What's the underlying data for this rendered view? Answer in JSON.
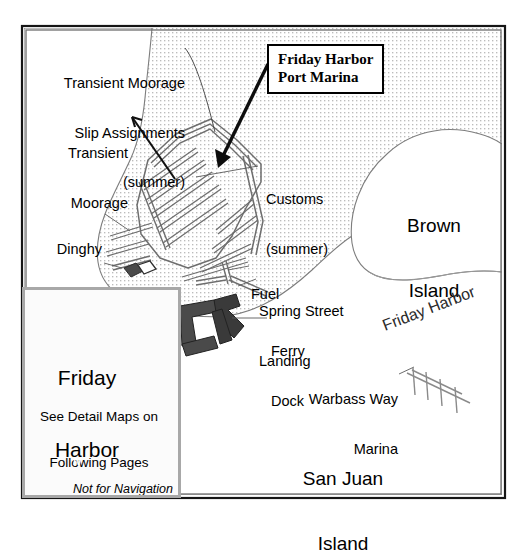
{
  "map": {
    "title_box": {
      "line1": "Friday Harbor",
      "line2": "Port Marina"
    },
    "water_body_label": "Friday Harbor",
    "land_labels": [
      {
        "name": "brown-island",
        "line1": "Brown",
        "line2": "Island"
      },
      {
        "name": "san-juan-island",
        "line1": "San Juan",
        "line2": "Island"
      }
    ],
    "feature_labels": [
      {
        "name": "transient-moorage-slip-assignments",
        "lines": [
          "Transient Moorage",
          "Slip Assignments",
          "(summer)"
        ]
      },
      {
        "name": "transient-moorage",
        "lines": [
          "Transient",
          "Moorage"
        ]
      },
      {
        "name": "dinghy-docks",
        "lines": [
          "Dinghy",
          "Docks"
        ]
      },
      {
        "name": "marina-office",
        "lines": [
          "Marina",
          "Office"
        ]
      },
      {
        "name": "customs",
        "lines": [
          "Customs",
          "(summer)"
        ]
      },
      {
        "name": "fuel",
        "lines": [
          "Fuel"
        ]
      },
      {
        "name": "spring-street-landing",
        "lines": [
          "Spring Street",
          "Landing"
        ]
      },
      {
        "name": "ferry-dock",
        "lines": [
          "Ferry",
          "Dock"
        ]
      },
      {
        "name": "warbass-way-marina",
        "lines": [
          "Warbass Way",
          "Marina"
        ]
      }
    ]
  },
  "inset": {
    "place_line1": "Friday",
    "place_line2": "Harbor",
    "note_line1": "See Detail Maps on",
    "note_line2": "Following Pages",
    "disclaimer_line1": "Not for Navigation",
    "disclaimer_line2": "Not to scale",
    "compass_letter": "N",
    "compass_icon": "compass-rose-icon"
  },
  "colors": {
    "frame": "#1a1a1a",
    "water_dot": "#b9b9b9",
    "shore_line": "#7a7a7a",
    "dock_outline": "#6e6e6e",
    "ferry_dock_fill": "#3b3b3b",
    "inset_border": "#a8a8a8",
    "inset_hatch": "#d2d2d2",
    "inset_road": "#9a9a9a",
    "text": "#000000",
    "background": "#ffffff"
  }
}
